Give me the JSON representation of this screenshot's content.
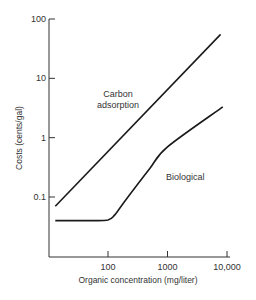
{
  "chart_data": {
    "type": "line",
    "title": "",
    "xlabel": "Organic concentration (mg/liter)",
    "ylabel": "Costs (cents/gal)",
    "xscale": "log",
    "yscale": "log",
    "xlim": [
      10,
      10000
    ],
    "ylim": [
      0.01,
      100
    ],
    "x_ticks": [
      {
        "value": 100,
        "label": "100"
      },
      {
        "value": 1000,
        "label": "1000"
      },
      {
        "value": 10000,
        "label": "10,000"
      }
    ],
    "y_ticks": [
      {
        "value": 0.1,
        "label": "0.1"
      },
      {
        "value": 1,
        "label": "1"
      },
      {
        "value": 10,
        "label": "10"
      },
      {
        "value": 100,
        "label": "100"
      }
    ],
    "grid": false,
    "legend": "none (inline labels)",
    "series": [
      {
        "name": "Carbon adsorption",
        "label_lines": [
          "Carbon",
          "adsorption"
        ],
        "x": [
          13,
          7800
        ],
        "y": [
          0.07,
          55
        ]
      },
      {
        "name": "Biological",
        "label_lines": [
          "Biological"
        ],
        "x": [
          13,
          50,
          100,
          130,
          200,
          500,
          1000,
          8500
        ],
        "y": [
          0.04,
          0.04,
          0.041,
          0.05,
          0.09,
          0.3,
          0.7,
          3.3
        ]
      }
    ]
  }
}
